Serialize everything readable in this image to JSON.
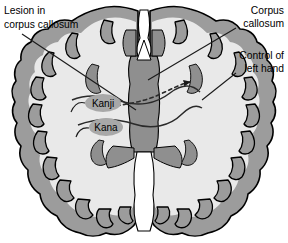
{
  "figure": {
    "kind": "axial-brain-cross-section-diagram",
    "background_color": "#ffffff",
    "width": 288,
    "height": 243
  },
  "colors": {
    "cortex_gray": "#9c9c9c",
    "white_matter": "#e9e9e9",
    "deep_gray": "#8f8f8f",
    "outline": "#000000",
    "fissure_white": "#ffffff",
    "badge_fill": "#a8a8a8",
    "leader_line": "#1a1a1a",
    "text": "#000000"
  },
  "callouts": [
    {
      "id": "lesion",
      "line1": "Lesion in",
      "line2": "corpus callosum",
      "align": "left",
      "x": 4,
      "y1": 12,
      "y2": 26
    },
    {
      "id": "corpus-callosum",
      "line1": "Corpus",
      "line2": "callosum",
      "align": "right",
      "x": 284,
      "y1": 12,
      "y2": 25
    },
    {
      "id": "control-left-hand",
      "line1": "Control of",
      "line2": "left hand",
      "align": "right",
      "x": 284,
      "y1": 57,
      "y2": 70
    }
  ],
  "region_badges": [
    {
      "id": "kanji",
      "label": "Kanji",
      "cx": 103,
      "cy": 103,
      "rx": 18,
      "ry": 9
    },
    {
      "id": "kana",
      "label": "Kana",
      "cx": 106,
      "cy": 127,
      "rx": 17,
      "ry": 9
    }
  ],
  "annotations": {
    "dashed_pathway": "interhemispheric transfer pathway crossing corpus callosum",
    "arrowhead": "terminates at right motor cortex controlling left hand"
  }
}
